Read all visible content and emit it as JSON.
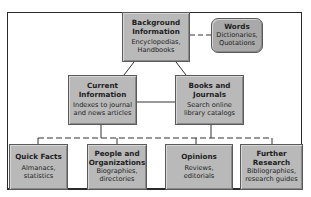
{
  "diagram": {
    "nodes": [
      {
        "id": "background",
        "title": "Background Information",
        "sub": "Encyclopedias, Handbooks"
      },
      {
        "id": "words",
        "title": "Words",
        "sub": "Dictionaries, Quotations"
      },
      {
        "id": "current",
        "title": "Current Information",
        "sub": "Indexes to journal and news articles"
      },
      {
        "id": "books",
        "title": "Books and Journals",
        "sub": "Search online library catalogs"
      },
      {
        "id": "quick",
        "title": "Quick Facts",
        "sub": "Almanacs, statistics"
      },
      {
        "id": "people",
        "title": "People and Organizations",
        "sub": "Biographies, directories"
      },
      {
        "id": "opinions",
        "title": "Opinions",
        "sub": "Reviews, editorials"
      },
      {
        "id": "further",
        "title": "Further Research",
        "sub": "Bibliographies, research guides"
      }
    ],
    "edges": [
      {
        "from": "background",
        "to": "words",
        "style": "dashed"
      },
      {
        "from": "background",
        "to": "current",
        "style": "solid"
      },
      {
        "from": "background",
        "to": "books",
        "style": "solid"
      },
      {
        "from": "current",
        "to": "books",
        "style": "solid"
      },
      {
        "from": "current",
        "to": "quick",
        "style": "dashed"
      },
      {
        "from": "current",
        "to": "people",
        "style": "dashed"
      },
      {
        "from": "books",
        "to": "opinions",
        "style": "dashed"
      },
      {
        "from": "books",
        "to": "further",
        "style": "dashed"
      }
    ]
  }
}
